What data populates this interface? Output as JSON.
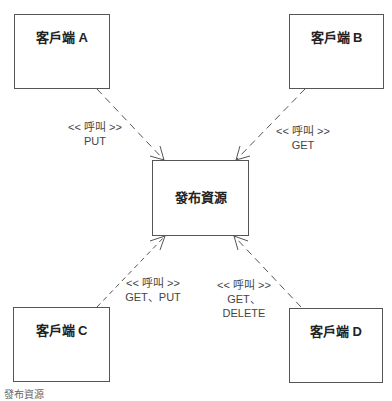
{
  "diagram": {
    "center": {
      "title": "發布資源"
    },
    "clients": [
      {
        "id": "A",
        "title": "客戶端 A",
        "stereotype": "<< 呼叫 >>",
        "methods": [
          "PUT"
        ]
      },
      {
        "id": "B",
        "title": "客戶端 B",
        "stereotype": "<< 呼叫 >>",
        "methods": [
          "GET"
        ]
      },
      {
        "id": "C",
        "title": "客戶端 C",
        "stereotype": "<< 呼叫 >>",
        "methods": [
          "GET、PUT"
        ]
      },
      {
        "id": "D",
        "title": "客戶端 D",
        "stereotype": "<< 呼叫 >>",
        "methods": [
          "GET、",
          "DELETE"
        ]
      }
    ],
    "footer": "發布資源"
  }
}
